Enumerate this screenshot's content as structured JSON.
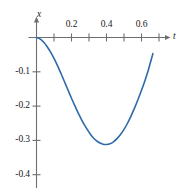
{
  "chart_data": {
    "type": "line",
    "title": "",
    "subtitle": "",
    "xlabel": "t",
    "ylabel": "x",
    "grid": false,
    "legend": null,
    "xlim": [
      -0.03,
      0.78
    ],
    "ylim": [
      -0.45,
      0.02
    ],
    "x_tick_labels": [
      "0.2",
      "0.4",
      "0.6"
    ],
    "x_tick_values": [
      0.2,
      0.4,
      0.6
    ],
    "x_minor_tick_values": [
      0.1,
      0.3,
      0.5,
      0.7
    ],
    "y_tick_labels": [
      "-0.1",
      "-0.2",
      "-0.3",
      "-0.4"
    ],
    "y_tick_values": [
      -0.1,
      -0.2,
      -0.3,
      -0.4
    ],
    "series": [
      {
        "name": "x(t)",
        "color": "#2f6aa8",
        "x": [
          0.0,
          0.02,
          0.04,
          0.06,
          0.08,
          0.1,
          0.12,
          0.14,
          0.16,
          0.18,
          0.2,
          0.22,
          0.24,
          0.26,
          0.28,
          0.3,
          0.32,
          0.34,
          0.36,
          0.38,
          0.4,
          0.42,
          0.44,
          0.46,
          0.48,
          0.5,
          0.52,
          0.54,
          0.56,
          0.58,
          0.6,
          0.62,
          0.64,
          0.665
        ],
        "y": [
          0.0,
          -0.004,
          -0.013,
          -0.026,
          -0.042,
          -0.061,
          -0.082,
          -0.105,
          -0.129,
          -0.153,
          -0.177,
          -0.2,
          -0.222,
          -0.242,
          -0.26,
          -0.276,
          -0.29,
          -0.3,
          -0.307,
          -0.311,
          -0.312,
          -0.31,
          -0.304,
          -0.295,
          -0.283,
          -0.268,
          -0.25,
          -0.229,
          -0.206,
          -0.181,
          -0.154,
          -0.125,
          -0.093,
          -0.047
        ]
      }
    ],
    "annotations": {
      "minimum_value": -0.312,
      "minimum_at_t": 0.4,
      "start_point": [
        0.0,
        0.0
      ],
      "end_point": [
        0.665,
        -0.047
      ]
    },
    "axis_color": "#6e6e73",
    "text_color": "#1a1a1a"
  }
}
